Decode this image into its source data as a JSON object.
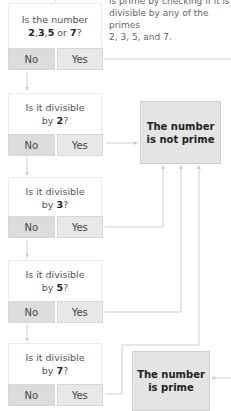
{
  "note": {
    "line1": "is prime by checking if it is",
    "line2": "divisible by any of the primes",
    "line3": "2, 3, 5, and 7."
  },
  "questions": [
    {
      "prefix": "Is the number",
      "bold1": "2",
      "sep1": ",",
      "bold2": "3",
      "sep2": ",",
      "bold3": "5",
      "mid": " or ",
      "bold4": "7",
      "suffix": "?"
    },
    {
      "line1": "Is it divisible",
      "by": "by ",
      "num": "2",
      "suffix": "?"
    },
    {
      "line1": "Is it divisible",
      "by": "by ",
      "num": "3",
      "suffix": "?"
    },
    {
      "line1": "Is it divisible",
      "by": "by ",
      "num": "5",
      "suffix": "?"
    },
    {
      "line1": "Is it divisible",
      "by": "by ",
      "num": "7",
      "suffix": "?"
    }
  ],
  "buttons": {
    "no": "No",
    "yes": "Yes"
  },
  "results": {
    "not_prime": {
      "line1": "The number",
      "line2": "is not prime"
    },
    "prime": {
      "line1": "The number",
      "line2": "is prime"
    }
  },
  "colors": {
    "line": "#cccccc",
    "box_fill": "#e4e4e4",
    "button_fill": "#e8e8e8"
  }
}
